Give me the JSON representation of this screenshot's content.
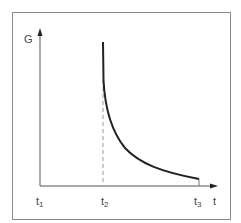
{
  "diagram": {
    "y_axis_label": "G",
    "x_axis_label": "t",
    "ticks": [
      {
        "name": "t",
        "sub": "1"
      },
      {
        "name": "t",
        "sub": "2"
      },
      {
        "name": "t",
        "sub": "3"
      }
    ],
    "curve_description": "Hyperbolic decay starting at t2 and falling toward t3",
    "colors": {
      "frame": "#888888",
      "axis": "#555555",
      "curve": "#222222",
      "dashed": "#999999"
    }
  }
}
